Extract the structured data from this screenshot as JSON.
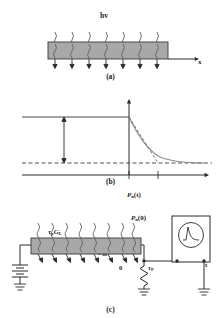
{
  "figure": {
    "caption_a": "(a)",
    "caption_b": "(b)",
    "caption_c": "(c)"
  },
  "panel_a": {
    "photon_label": "hv",
    "axis_label_x": "x",
    "num_photon_arrows": 8,
    "bar_fill": "#a8a8a8",
    "bar_stroke": "#3a3a3a"
  },
  "panel_b": {
    "y_axis_label_main": "P",
    "y_axis_label_sub": "n",
    "y_axis_label_arg": "(t)",
    "initial_value_label_main": "P",
    "initial_value_label_sub": "n",
    "initial_value_label_arg": "(0)",
    "bracket_label_main": "τ",
    "bracket_label_sub1": "p",
    "bracket_label_main2": "G",
    "bracket_label_sub2": "L",
    "baseline_label_main": "P",
    "baseline_label_sub": "no",
    "origin_label": "0",
    "tick_label_main": "τ",
    "tick_label_sub": "P",
    "x_axis_label": "t",
    "curve_type": "exponential-decay",
    "curve_color": "#8a8a8a",
    "tangent_style": "dashed"
  },
  "panel_c": {
    "light_label": "光照射",
    "voltage_label": "V",
    "num_photon_arrows": 8,
    "components": [
      "battery",
      "semiconductor-bar",
      "load-resistor",
      "oscilloscope",
      "ground"
    ],
    "oscilloscope_trace": "pulse-decay",
    "bar_fill": "#a8a8a8",
    "bar_stroke": "#3a3a3a"
  }
}
